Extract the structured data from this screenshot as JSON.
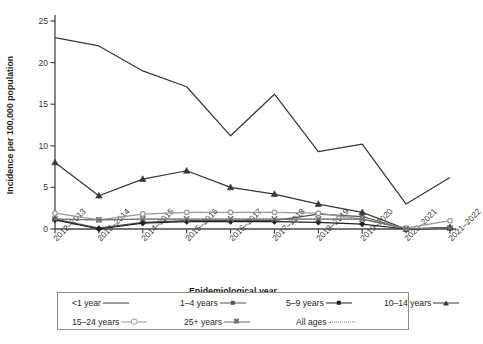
{
  "chart": {
    "type": "line",
    "ylabel": "Incidence per 100,000 population",
    "xlabel": "Epidemiological year"
  },
  "chart_data": {
    "type": "line",
    "title": "",
    "subtitle": "",
    "xlabel": "Epidemiological year",
    "ylabel": "Incidence per 100,000 population",
    "categories": [
      "2012–2013",
      "2013–2014",
      "2014–2015",
      "2015–2016",
      "2016–2017",
      "2017–2018",
      "2018–2019",
      "2019–2020",
      "2020–2021",
      "2021–2022"
    ],
    "ylim": [
      0,
      25
    ],
    "yticks": [
      0,
      5,
      10,
      15,
      20,
      25
    ],
    "grid": false,
    "legend_position": "bottom",
    "series": [
      {
        "name": "<1 year",
        "marker": "none",
        "color": "#3a3637",
        "dash": "solid",
        "values": [
          23.0,
          22.0,
          19.0,
          17.1,
          11.2,
          16.2,
          9.3,
          10.2,
          3.0,
          6.2
        ]
      },
      {
        "name": "1–4 years",
        "marker": "diamond",
        "color": "#55504f",
        "dash": "solid",
        "values": [
          1.2,
          0.1,
          0.8,
          1.0,
          1.0,
          1.0,
          1.8,
          1.5,
          0.0,
          0.1
        ]
      },
      {
        "name": "5–9 years",
        "marker": "diamond-filled",
        "color": "#231f20",
        "dash": "solid",
        "values": [
          1.1,
          0.0,
          0.7,
          0.9,
          0.9,
          0.9,
          0.8,
          0.6,
          0.0,
          0.1
        ]
      },
      {
        "name": "10–14 years",
        "marker": "triangle",
        "color": "#3a3637",
        "dash": "solid",
        "values": [
          8.0,
          4.0,
          6.0,
          7.0,
          5.0,
          4.2,
          3.0,
          2.0,
          0.0,
          0.2
        ]
      },
      {
        "name": "15–24 years",
        "marker": "circle",
        "color": "#9a9899",
        "dash": "solid",
        "values": [
          1.9,
          1.1,
          1.8,
          2.0,
          2.0,
          2.0,
          1.9,
          1.2,
          0.1,
          1.0
        ]
      },
      {
        "name": "25+ years",
        "marker": "x",
        "color": "#6e6a6b",
        "dash": "solid",
        "values": [
          1.2,
          1.1,
          1.2,
          1.2,
          1.2,
          1.2,
          1.2,
          1.2,
          0.05,
          0.1
        ]
      },
      {
        "name": "All ages",
        "marker": "none",
        "color": "#7d7a7b",
        "dash": "dotted",
        "values": [
          1.2,
          1.1,
          1.2,
          1.2,
          1.2,
          1.2,
          1.2,
          1.2,
          0.05,
          0.1
        ]
      }
    ]
  },
  "legend": {
    "row1": [
      {
        "label": "<1 year",
        "marker": "none",
        "color": "#3a3637",
        "dash": "solid"
      },
      {
        "label": "1–4 years",
        "marker": "diamond",
        "color": "#55504f",
        "dash": "solid"
      },
      {
        "label": "5–9 years",
        "marker": "diamond-filled",
        "color": "#231f20",
        "dash": "solid"
      },
      {
        "label": "10–14 years",
        "marker": "triangle",
        "color": "#3a3637",
        "dash": "solid"
      }
    ],
    "row2": [
      {
        "label": "15–24 years",
        "marker": "circle",
        "color": "#9a9899",
        "dash": "solid"
      },
      {
        "label": "25+ years",
        "marker": "x",
        "color": "#6e6a6b",
        "dash": "solid"
      },
      {
        "label": "All ages",
        "marker": "none",
        "color": "#7d7a7b",
        "dash": "dotted"
      }
    ]
  }
}
